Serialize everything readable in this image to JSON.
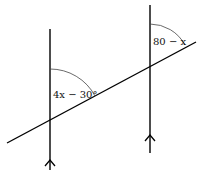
{
  "diagram": {
    "type": "parallel lines cut by transversal",
    "angles": [
      {
        "id": "left",
        "label": "4x − 30°"
      },
      {
        "id": "right",
        "label": "80 − x"
      }
    ],
    "parallel_marker": "arrow"
  }
}
